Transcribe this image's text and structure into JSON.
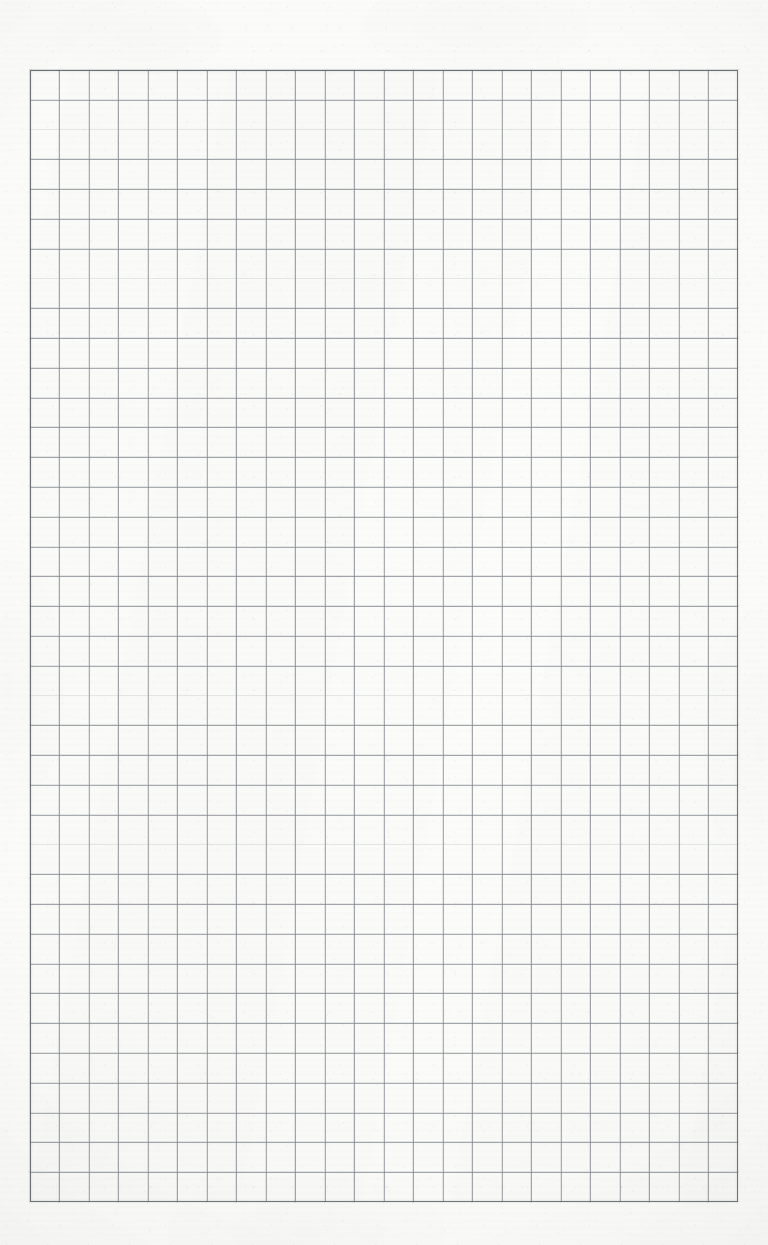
{
  "document": {
    "kind": "scanned-graph-paper",
    "title": "Blank graph paper sheet",
    "page_width_px": 768,
    "page_height_px": 1245,
    "has_text": false,
    "has_handwriting": false,
    "visible_text": ""
  },
  "paper": {
    "background_color": "#fbfbfa",
    "highlight_color": "#fdfdfc",
    "edge_shade_color": "#f1f1f0",
    "texture": "fine scanner grain with faint horizontal banding"
  },
  "grid": {
    "line_color": "#787e84",
    "border_color": "#686c70",
    "cell_size_px": 29.5,
    "columns": 24,
    "rows": 38,
    "left_px": 30,
    "top_px": 70,
    "width_px": 708,
    "height_px": 1132,
    "margin_left_px": 30,
    "margin_top_px": 70,
    "margin_right_px": 30,
    "margin_bottom_px": 43,
    "subdivisions": "none",
    "style": "uniform single-weight square grid with darker printed outer frame"
  }
}
